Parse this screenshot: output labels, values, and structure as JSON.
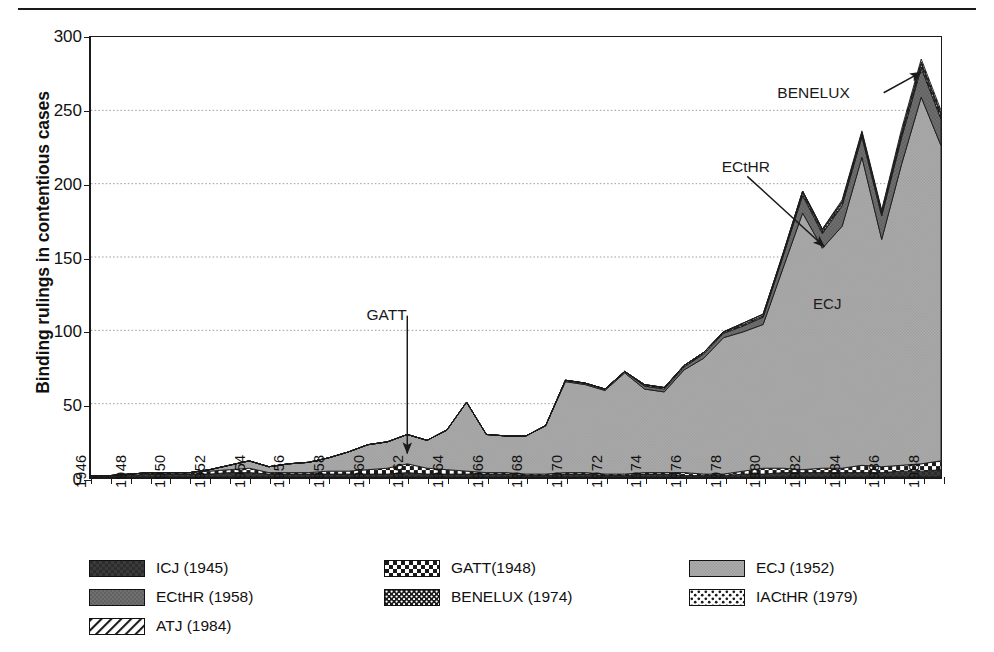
{
  "chart_data": {
    "type": "area",
    "stacked": true,
    "title": "",
    "xlabel": "",
    "ylabel": "Binding rulings in contentious cases",
    "ylim": [
      0,
      300
    ],
    "ytick_values": [
      0,
      50,
      100,
      150,
      200,
      250,
      300
    ],
    "ytick_labels": [
      "0",
      "50",
      "100",
      "150",
      "200",
      "250",
      "300"
    ],
    "grid": "horizontal-dotted",
    "legend_position": "below-plot",
    "x": [
      1946,
      1947,
      1948,
      1949,
      1950,
      1951,
      1952,
      1953,
      1954,
      1955,
      1956,
      1957,
      1958,
      1959,
      1960,
      1961,
      1962,
      1963,
      1964,
      1965,
      1966,
      1967,
      1968,
      1969,
      1970,
      1971,
      1972,
      1973,
      1974,
      1975,
      1976,
      1977,
      1978,
      1979,
      1980,
      1981,
      1982,
      1983,
      1984,
      1985,
      1986,
      1987,
      1988,
      1989
    ],
    "xtick_labels": [
      "1946",
      "1948",
      "1950",
      "1952",
      "1954",
      "1956",
      "1958",
      "1960",
      "1962",
      "1964",
      "1966",
      "1968",
      "1970",
      "1972",
      "1974",
      "1976",
      "1978",
      "1980",
      "1982",
      "1984",
      "1986",
      "1988"
    ],
    "xtick_step_years": 2,
    "series": [
      {
        "name": "ICJ (1945)",
        "legend_label": "ICJ (1945)",
        "pattern": "solid-dark",
        "color": "#3a3a3a",
        "values": [
          1,
          1,
          1,
          2,
          2,
          2,
          2,
          3,
          3,
          2,
          2,
          2,
          2,
          2,
          2,
          2,
          3,
          2,
          2,
          2,
          2,
          2,
          1,
          1,
          2,
          2,
          1,
          1,
          2,
          2,
          1,
          1,
          1,
          2,
          2,
          3,
          3,
          3,
          3,
          3,
          3,
          4,
          4,
          5
        ]
      },
      {
        "name": "GATT(1948)",
        "legend_label": "GATT(1948)",
        "pattern": "checker-coarse",
        "color": "#ffffff",
        "values": [
          0,
          0,
          1,
          1,
          1,
          1,
          2,
          2,
          3,
          1,
          1,
          1,
          2,
          2,
          3,
          4,
          6,
          4,
          3,
          2,
          1,
          1,
          1,
          1,
          1,
          1,
          1,
          1,
          1,
          1,
          2,
          1,
          1,
          2,
          4,
          3,
          2,
          3,
          3,
          5,
          4,
          4,
          5,
          6
        ]
      },
      {
        "name": "ECJ (1952)",
        "legend_label": "ECJ (1952)",
        "pattern": "solid-light",
        "color": "#a6a6a6",
        "values": [
          0,
          0,
          0,
          0,
          0,
          0,
          1,
          3,
          5,
          4,
          6,
          7,
          9,
          13,
          17,
          18,
          20,
          19,
          27,
          47,
          26,
          25,
          26,
          33,
          62,
          60,
          57,
          69,
          57,
          55,
          70,
          79,
          93,
          95,
          98,
          136,
          175,
          150,
          165,
          210,
          155,
          205,
          250,
          215
        ]
      },
      {
        "name": "ECtHR (1958)",
        "legend_label": "ECtHR (1958)",
        "pattern": "solid-mid",
        "color": "#6e6e6e",
        "values": [
          0,
          0,
          0,
          0,
          0,
          0,
          0,
          0,
          0,
          0,
          0,
          0,
          0,
          0,
          0,
          0,
          0,
          0,
          0,
          0,
          0,
          0,
          0,
          0,
          1,
          1,
          1,
          1,
          2,
          2,
          2,
          3,
          3,
          4,
          5,
          8,
          12,
          10,
          14,
          14,
          16,
          18,
          20,
          18
        ]
      },
      {
        "name": "BENELUX (1974)",
        "legend_label": "BENELUX (1974)",
        "pattern": "checker-fine",
        "color": "#ffffff",
        "values": [
          0,
          0,
          0,
          0,
          0,
          0,
          0,
          0,
          0,
          0,
          0,
          0,
          0,
          0,
          0,
          0,
          0,
          0,
          0,
          0,
          0,
          0,
          0,
          0,
          0,
          0,
          0,
          0,
          1,
          1,
          1,
          1,
          1,
          1,
          1,
          1,
          2,
          2,
          2,
          2,
          2,
          3,
          3,
          3
        ]
      },
      {
        "name": "IACtHR (1979)",
        "legend_label": "IACtHR (1979)",
        "pattern": "dots-sparse",
        "color": "#ffffff",
        "values": [
          0,
          0,
          0,
          0,
          0,
          0,
          0,
          0,
          0,
          0,
          0,
          0,
          0,
          0,
          0,
          0,
          0,
          0,
          0,
          0,
          0,
          0,
          0,
          0,
          0,
          0,
          0,
          0,
          0,
          0,
          0,
          0,
          0,
          1,
          1,
          1,
          1,
          1,
          1,
          1,
          1,
          1,
          1,
          1
        ]
      },
      {
        "name": "ATJ (1984)",
        "legend_label": "ATJ (1984)",
        "pattern": "diagonal-hatch",
        "color": "#ffffff",
        "values": [
          0,
          0,
          0,
          0,
          0,
          0,
          0,
          0,
          0,
          0,
          0,
          0,
          0,
          0,
          0,
          0,
          0,
          0,
          0,
          0,
          0,
          0,
          0,
          0,
          0,
          0,
          0,
          0,
          0,
          0,
          0,
          0,
          0,
          0,
          0,
          0,
          0,
          0,
          1,
          1,
          1,
          2,
          2,
          2
        ]
      }
    ],
    "totals": [
      1,
      1,
      2,
      3,
      3,
      3,
      5,
      8,
      11,
      7,
      9,
      10,
      13,
      17,
      22,
      24,
      29,
      25,
      32,
      51,
      29,
      28,
      28,
      35,
      66,
      64,
      60,
      72,
      63,
      61,
      76,
      85,
      99,
      105,
      111,
      152,
      195,
      169,
      188,
      236,
      182,
      237,
      285,
      250
    ],
    "annotations": [
      {
        "label": "GATT",
        "points_to_year": 1962,
        "points_to_value": 8,
        "arrow": "down"
      },
      {
        "label": "ECtHR",
        "points_to_year": 1983,
        "points_to_value": 162,
        "arrow": "down-right"
      },
      {
        "label": "BENELUX",
        "points_to_year": 1988,
        "points_to_value": 272,
        "arrow": "up-right"
      },
      {
        "label": "ECJ",
        "points_to_year": 1983,
        "points_to_value": 95,
        "arrow": "none"
      }
    ]
  },
  "legend": {
    "items": [
      {
        "label": "ICJ (1945)"
      },
      {
        "label": "GATT(1948)"
      },
      {
        "label": "ECJ (1952)"
      },
      {
        "label": "ECtHR (1958)"
      },
      {
        "label": "BENELUX (1974)"
      },
      {
        "label": "IACtHR (1979)"
      },
      {
        "label": "ATJ (1984)"
      }
    ]
  },
  "axis": {
    "y_title": "Binding rulings in contentious cases"
  },
  "annotations": {
    "gatt": "GATT",
    "ecthr": "ECtHR",
    "benelux": "BENELUX",
    "ecj": "ECJ"
  }
}
